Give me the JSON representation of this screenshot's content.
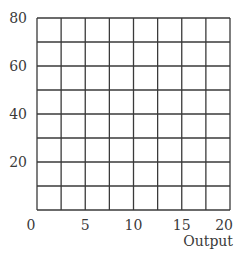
{
  "chart_data": {
    "type": "line",
    "title": "",
    "xlabel": "Output",
    "ylabel": "",
    "xlim": [
      0,
      20
    ],
    "ylim": [
      0,
      80
    ],
    "x_ticks": [
      0,
      5,
      10,
      15,
      20
    ],
    "y_ticks": [
      20,
      40,
      60,
      80
    ],
    "x_tick_labels": [
      "0",
      "5",
      "10",
      "15",
      "20"
    ],
    "y_tick_labels": [
      "20",
      "40",
      "60",
      "80"
    ],
    "grid": true,
    "grid_columns": 8,
    "grid_rows": 8,
    "series": [],
    "legend": null
  },
  "axes": {
    "xlabel": "Output"
  }
}
